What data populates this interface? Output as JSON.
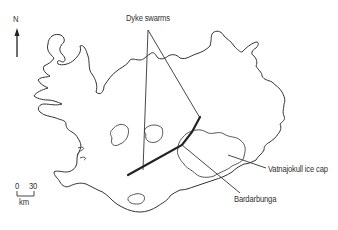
{
  "map": {
    "subject": "Iceland",
    "north_arrow": {
      "label": "N"
    },
    "labels": {
      "dyke_swarms": "Dyke swarms",
      "vatnajokull": "Vatnajokull ice cap",
      "bardarbunga": "Bardarbunga"
    },
    "scale_bar": {
      "start": "0",
      "end": "30",
      "unit": "km"
    },
    "colors": {
      "line": "#333333",
      "background": "#ffffff"
    }
  }
}
